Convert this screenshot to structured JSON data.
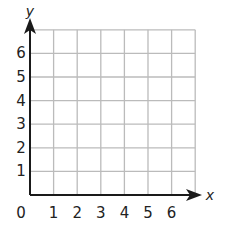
{
  "chart_data": {
    "type": "coordinate-grid",
    "title": "",
    "xlabel": "x",
    "ylabel": "y",
    "origin_label": "0",
    "x_ticks": [
      "1",
      "2",
      "3",
      "4",
      "5",
      "6"
    ],
    "y_ticks": [
      "1",
      "2",
      "3",
      "4",
      "5",
      "6"
    ],
    "xlim": [
      0,
      7
    ],
    "ylim": [
      0,
      7
    ],
    "grid": true,
    "points": []
  },
  "colors": {
    "grid": "#bbbbbb",
    "axis": "#1a1a1a",
    "text": "#222222"
  }
}
